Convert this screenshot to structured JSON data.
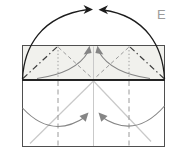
{
  "step_label": "E",
  "diagram": {
    "kind": "origami fold step",
    "colors": {
      "background": "#ffffff",
      "paper_fill": "#f1f1ed",
      "lower_fill": "#ffffff",
      "paper_outline": "#4f4f4f",
      "folded_edge": "#242424",
      "mountain_fold": "#3c3c3c",
      "valley_fold": "#9a9a9a",
      "dotted_crease": "#9a9a9a",
      "reference_crease": "#c9c9c9",
      "gray_arrow": "#858585",
      "black_arrow": "#1c1c1c",
      "label_text": "#9b9b9b"
    }
  }
}
